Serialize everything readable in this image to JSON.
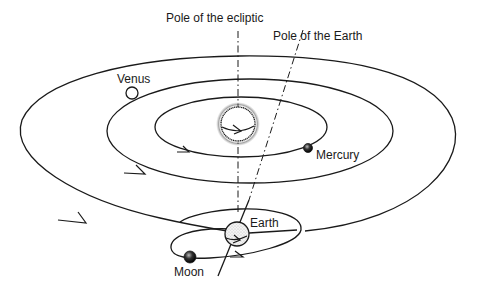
{
  "diagram": {
    "type": "solar-system-orbits",
    "labels": {
      "pole_ecliptic": "Pole of the ecliptic",
      "pole_earth": "Pole of the Earth",
      "venus": "Venus",
      "mercury": "Mercury",
      "earth": "Earth",
      "moon": "Moon"
    },
    "bodies": [
      {
        "name": "Sun",
        "shading": "fuzzy-stippled"
      },
      {
        "name": "Mercury",
        "shading": "dark"
      },
      {
        "name": "Venus",
        "shading": "hollow"
      },
      {
        "name": "Earth",
        "shading": "stippled"
      },
      {
        "name": "Moon",
        "shading": "dark"
      }
    ],
    "orbits": [
      "Mercury orbit",
      "Venus orbit",
      "Earth orbit",
      "Moon orbit"
    ],
    "colors": {
      "ink": "#1a1a1a",
      "background": "#ffffff"
    }
  }
}
